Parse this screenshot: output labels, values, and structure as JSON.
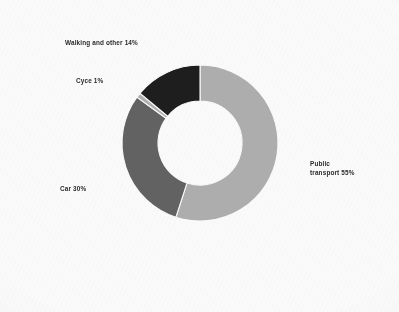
{
  "figure": {
    "background_color": "#fafafa",
    "label_color": "#2b2b2b",
    "separator_color": "#fafafa"
  },
  "chart_data": {
    "type": "pie",
    "variant": "donut",
    "title": "",
    "subtitle": "",
    "xlabel": "",
    "ylabel": "",
    "legend_position": "none",
    "grid": false,
    "units": "percent",
    "total": 100,
    "start_angle_deg": 0,
    "direction": "clockwise",
    "outer_radius_px": 78,
    "inner_radius_px": 42,
    "center_px": [
      200,
      143
    ],
    "categories": [
      "Public transport",
      "Car",
      "Cycle",
      "Walking and other"
    ],
    "values": [
      55,
      30,
      1,
      14
    ],
    "colors": [
      "#adadad",
      "#626262",
      "#b0b0b0",
      "#1e1e1e"
    ],
    "slices": [
      {
        "name": "Public transport",
        "value": 55,
        "label": "Public\ntransport 55%",
        "label_line_1": "Public",
        "label_line_2": "transport 55%",
        "color": "#adadad",
        "start_deg": 0,
        "end_deg": 198
      },
      {
        "name": "Car",
        "value": 30,
        "label": "Car 30%",
        "color": "#626262",
        "start_deg": 198,
        "end_deg": 306
      },
      {
        "name": "Cycle",
        "value": 1,
        "label": "Cyce 1%",
        "color": "#b0b0b0",
        "start_deg": 306,
        "end_deg": 309.6
      },
      {
        "name": "Walking and other",
        "value": 14,
        "label": "Walking and other 14%",
        "color": "#1e1e1e",
        "start_deg": 309.6,
        "end_deg": 360
      }
    ]
  }
}
